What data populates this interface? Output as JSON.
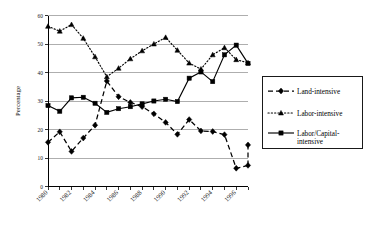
{
  "chart_data": {
    "type": "line",
    "title": "",
    "xlabel": "",
    "ylabel": "Percentage",
    "ylim": [
      0,
      60
    ],
    "xlim": [
      1980,
      1997
    ],
    "grid": true,
    "legend_position": "right",
    "y_ticks": [
      "0",
      "10",
      "20",
      "30",
      "40",
      "50",
      "60"
    ],
    "y_tick_values": [
      0,
      10,
      20,
      30,
      40,
      50,
      60
    ],
    "x": [
      1980,
      1981,
      1982,
      1983,
      1984,
      1985,
      1986,
      1987,
      1988,
      1989,
      1990,
      1991,
      1992,
      1993,
      1994,
      1995,
      1996,
      1997
    ],
    "x_tick_labels": [
      "1980",
      "",
      "1982",
      "",
      "1984",
      "",
      "1986",
      "",
      "1988",
      "",
      "1990",
      "",
      "1992",
      "",
      "1994",
      "",
      "1996",
      ""
    ],
    "x_labels_shown": [
      "1980",
      "1982",
      "1984",
      "1986",
      "1988",
      "1990",
      "1992",
      "1994",
      "1996"
    ],
    "series": [
      {
        "name": "Land-intensive",
        "marker": "diamond",
        "dash": "dashed",
        "values": [
          15.5,
          19.2,
          12.3,
          17.0,
          21.5,
          37.0,
          31.5,
          29.5,
          28.0,
          25.5,
          22.5,
          18.3,
          23.5,
          19.5,
          19.3,
          18.2,
          6.4,
          7.4
        ]
      },
      {
        "name": "Labor-intensive",
        "marker": "triangle",
        "dash": "dotted",
        "values": [
          56.2,
          54.5,
          56.8,
          52.0,
          45.5,
          38.5,
          41.5,
          44.8,
          47.6,
          50.0,
          52.3,
          47.8,
          43.3,
          41.2,
          46.2,
          48.7,
          44.5,
          43.4
        ]
      },
      {
        "name": "Labor/Capital-intensive",
        "marker": "square",
        "dash": "solid",
        "values": [
          28.4,
          26.4,
          31.1,
          31.3,
          29.2,
          26.0,
          27.3,
          28.0,
          29.0,
          30.0,
          30.6,
          29.8,
          38.0,
          40.2,
          36.8,
          46.2,
          49.6,
          43.2
        ]
      }
    ],
    "extra_land_tail": [
      14.6
    ],
    "extra_note": "Land-intensive final point rises to about 14.6"
  },
  "legend": {
    "entries": [
      {
        "label": "Land-intensive"
      },
      {
        "label": "Labor-intensive"
      },
      {
        "label": "Labor/Capital-"
      },
      {
        "label": "intensive"
      }
    ]
  },
  "colors": {
    "ink": "#000000",
    "grid": "#9a9a9a",
    "background": "#ffffff"
  }
}
